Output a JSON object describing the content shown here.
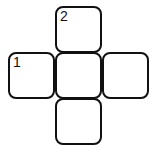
{
  "puzzle": {
    "type": "crossword-grid",
    "cells": [
      {
        "id": "top",
        "number": "2",
        "col": 1,
        "row": 0
      },
      {
        "id": "left",
        "number": "1",
        "col": 0,
        "row": 1
      },
      {
        "id": "center",
        "number": "",
        "col": 1,
        "row": 1
      },
      {
        "id": "right",
        "number": "",
        "col": 2,
        "row": 1
      },
      {
        "id": "bottom",
        "number": "",
        "col": 1,
        "row": 2
      }
    ]
  }
}
